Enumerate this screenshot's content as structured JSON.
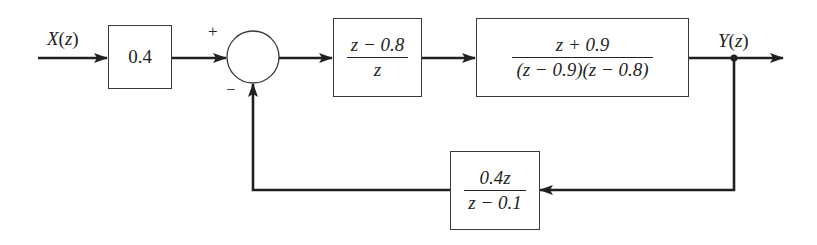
{
  "diagram": {
    "type": "discrete-time feedback control block diagram",
    "input": {
      "label": "X(z)",
      "var": "X",
      "arg": "z"
    },
    "output": {
      "label": "Y(z)",
      "var": "Y",
      "arg": "z"
    },
    "blocks": [
      {
        "id": "gain",
        "text": "0.4"
      },
      {
        "id": "controller",
        "numerator": "z − 0.8",
        "denominator": "z"
      },
      {
        "id": "plant",
        "numerator": "z + 0.9",
        "denominator": "(z − 0.9)(z − 0.8)"
      },
      {
        "id": "feedback",
        "numerator": "0.4z",
        "denominator": "z − 0.1"
      }
    ],
    "summing_junction": {
      "plus_sign": "+",
      "minus_sign": "−"
    }
  },
  "colors": {
    "line": "#231f20",
    "background": "#ffffff"
  }
}
